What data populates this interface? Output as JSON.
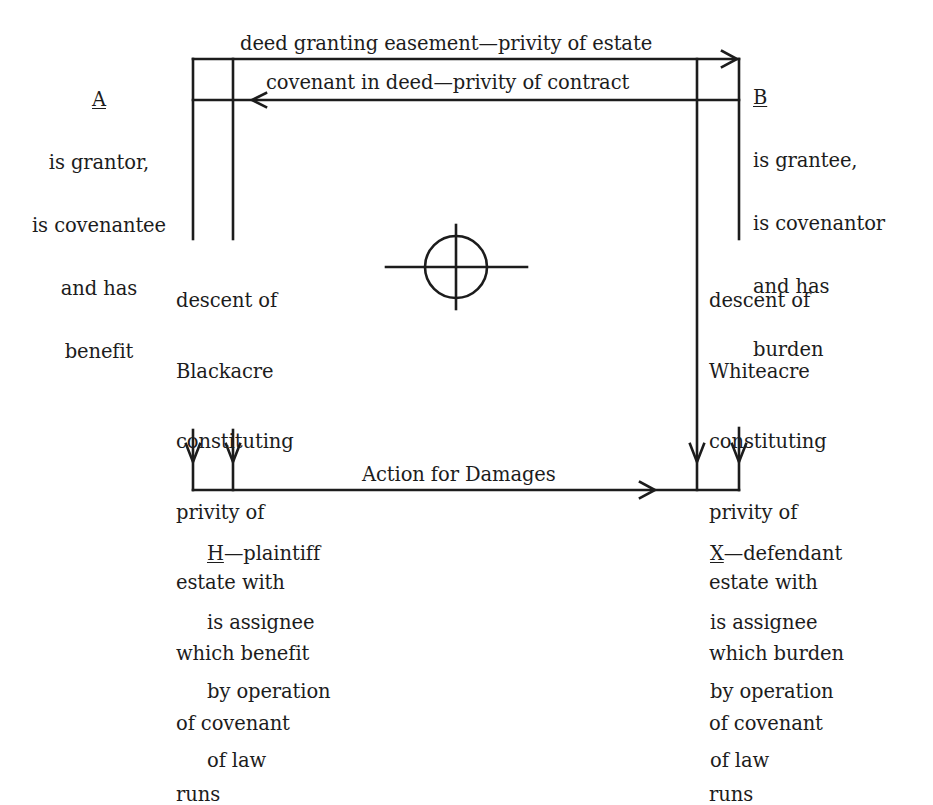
{
  "diagram": {
    "type": "legal privity diagram",
    "parties": {
      "A": {
        "letter": "A",
        "lines": [
          "is grantor,",
          "is covenantee",
          "and has",
          "benefit"
        ]
      },
      "B": {
        "letter": "B",
        "lines": [
          "is grantee,",
          "is covenantor",
          "and has",
          "burden"
        ]
      },
      "H": {
        "letter": "H",
        "suffix": "—plaintiff",
        "lines": [
          "is assignee",
          "by operation",
          "of law"
        ]
      },
      "X": {
        "letter": "X",
        "suffix": "—defendant",
        "lines": [
          "is assignee",
          "by operation",
          "of law"
        ]
      }
    },
    "edges": {
      "deed": "deed granting easement—privity of estate",
      "covenant": "covenant in deed—privity of contract",
      "action": "Action for Damages"
    },
    "descents": {
      "left": [
        "descent of",
        "Blackacre",
        "constituting",
        "privity of",
        "estate with",
        "which benefit",
        "of covenant",
        "runs"
      ],
      "right": [
        "descent of",
        "Whiteacre",
        "constituting",
        "privity of",
        "estate with",
        "which burden",
        "of covenant",
        "runs"
      ]
    },
    "center_symbol": "crosshair-circle",
    "colors": {
      "ink": "#1c1c1c",
      "paper": "#ffffff"
    }
  }
}
